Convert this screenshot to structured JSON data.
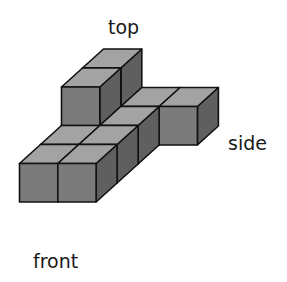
{
  "figure": {
    "labels": {
      "top": "top",
      "side": "side",
      "front": "front"
    },
    "colors": {
      "top_face": "#a3a3a3",
      "front_face": "#7b7b7b",
      "right_face": "#5f5f5f",
      "edge": "#111111",
      "background": "#ffffff"
    },
    "projection": {
      "origin": [
        19.5,
        202
      ],
      "unit_x": [
        38.3,
        0
      ],
      "unit_depth": [
        21,
        -19
      ],
      "unit_height": [
        0,
        -38.5
      ]
    },
    "cubes": [
      {
        "col": 0,
        "depth": 3,
        "level": 0
      },
      {
        "col": 0,
        "depth": 3,
        "level": 1
      },
      {
        "col": 1,
        "depth": 3,
        "level": 0
      },
      {
        "col": 2,
        "depth": 3,
        "level": 0
      },
      {
        "col": 0,
        "depth": 2,
        "level": 0
      },
      {
        "col": 0,
        "depth": 2,
        "level": 1
      },
      {
        "col": 1,
        "depth": 2,
        "level": 0
      },
      {
        "col": 0,
        "depth": 1,
        "level": 0
      },
      {
        "col": 1,
        "depth": 1,
        "level": 0
      },
      {
        "col": 0,
        "depth": 0,
        "level": 0
      },
      {
        "col": 1,
        "depth": 0,
        "level": 0
      }
    ]
  }
}
